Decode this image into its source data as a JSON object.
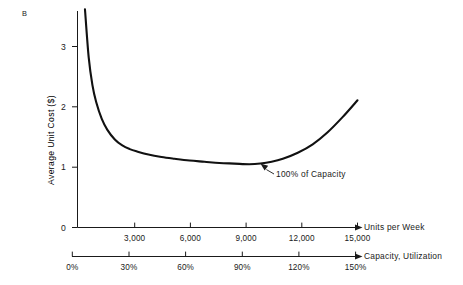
{
  "figure": {
    "panel_label": "B"
  },
  "chart_data": {
    "type": "line",
    "title": "",
    "subtitle": "",
    "xlabel": "Units per Week",
    "ylabel": "Average Unit Cost ($)",
    "secondary_xlabel": "Capacity, Utilization",
    "grid": false,
    "legend": "none",
    "xlim": [
      0,
      15000
    ],
    "ylim": [
      0,
      3.6
    ],
    "xticks": [
      3000,
      6000,
      9000,
      12000,
      15000
    ],
    "xticklabels": [
      "3,000",
      "6,000",
      "9,000",
      "12,000",
      "15,000"
    ],
    "yticks": [
      0,
      1,
      2,
      3
    ],
    "yticklabels": [
      "0",
      "1",
      "2",
      "3"
    ],
    "secondary_xticks": [
      0,
      30,
      60,
      90,
      120,
      150
    ],
    "secondary_xticklabels": [
      "0%",
      "30%",
      "60%",
      "90%",
      "120%",
      "150%"
    ],
    "series": [
      {
        "name": "Average unit cost",
        "x": [
          400,
          600,
          800,
          1000,
          1300,
          1600,
          2000,
          2400,
          2800,
          3200,
          3800,
          4500,
          5200,
          6000,
          6800,
          7600,
          8400,
          9200,
          9800,
          10400,
          11000,
          11800,
          12600,
          13400,
          14200,
          15000
        ],
        "y": [
          3.62,
          2.82,
          2.36,
          2.08,
          1.8,
          1.62,
          1.46,
          1.36,
          1.3,
          1.26,
          1.21,
          1.17,
          1.14,
          1.11,
          1.09,
          1.07,
          1.06,
          1.05,
          1.06,
          1.09,
          1.14,
          1.24,
          1.38,
          1.58,
          1.83,
          2.11
        ]
      }
    ],
    "annotations": [
      {
        "text": "100% of Capacity",
        "points_to_x": 9800,
        "points_to_y": 1.06
      }
    ]
  },
  "axis_ticks": {
    "y_values": [
      "3",
      "2",
      "1",
      "0"
    ],
    "x_values": [
      "3,000",
      "6,000",
      "9,000",
      "12,000",
      "15,000"
    ],
    "capacity_values": [
      "0%",
      "30%",
      "60%",
      "90%",
      "120%",
      "150%"
    ]
  },
  "labels": {
    "y_axis_title": "Average Unit Cost ($)",
    "x_axis_title": "Units per Week",
    "capacity_axis_title": "Capacity, Utilization",
    "annotation": "100% of Capacity"
  },
  "colors": {
    "background": "#ffffff",
    "ink": "#1a1a1a",
    "curve": "#111111"
  }
}
